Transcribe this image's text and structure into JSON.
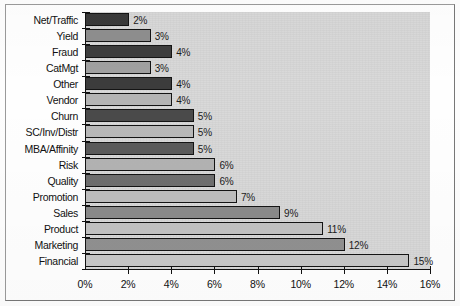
{
  "chart_data": {
    "type": "bar",
    "orientation": "horizontal",
    "title": "",
    "subtitle": "",
    "xlabel": "",
    "ylabel": "",
    "xlim": [
      0,
      16
    ],
    "xtick_labels": [
      "0%",
      "2%",
      "4%",
      "6%",
      "8%",
      "10%",
      "12%",
      "14%",
      "16%"
    ],
    "xticks": [
      0,
      2,
      4,
      6,
      8,
      10,
      12,
      14,
      16
    ],
    "grid": false,
    "legend": "none",
    "categories": [
      "Net/Traffic",
      "Yield",
      "Fraud",
      "CatMgt",
      "Other",
      "Vendor",
      "Churn",
      "SC/Inv/Distr",
      "MBA/Affinity",
      "Risk",
      "Quality",
      "Promotion",
      "Sales",
      "Product",
      "Marketing",
      "Financial"
    ],
    "values": [
      2,
      3,
      4,
      3,
      4,
      4,
      5,
      5,
      5,
      6,
      6,
      7,
      9,
      11,
      12,
      15
    ],
    "data_labels": [
      "2%",
      "3%",
      "4%",
      "3%",
      "4%",
      "4%",
      "5%",
      "5%",
      "5%",
      "6%",
      "6%",
      "7%",
      "9%",
      "11%",
      "12%",
      "15%"
    ],
    "bar_colors": [
      "#3a3a3a",
      "#8e8e8e",
      "#3d3d3d",
      "#a0a0a0",
      "#3c3c3c",
      "#b4b4b4",
      "#4a4a4a",
      "#b8b8b8",
      "#5a5a5a",
      "#b2b2b2",
      "#6e6e6e",
      "#bdbdbd",
      "#8a8a8a",
      "#c2c2c2",
      "#909090",
      "#c6c6c6"
    ],
    "plot_background": "#d8d8d8",
    "axis_color": "#111111",
    "label_color": "#1b1b1b"
  }
}
